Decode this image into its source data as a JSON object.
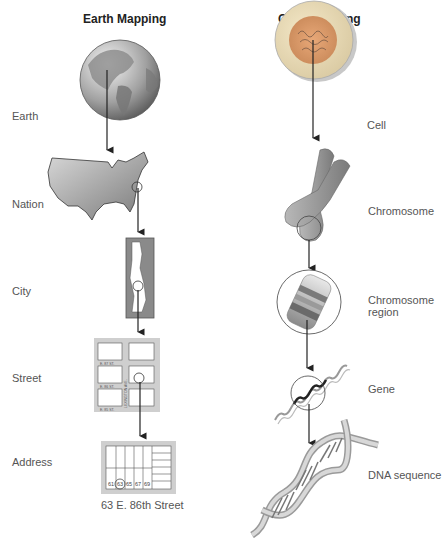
{
  "earth_column": {
    "title": "Earth Mapping",
    "levels": [
      {
        "label": "Earth",
        "icon": "globe-icon"
      },
      {
        "label": "Nation",
        "icon": "usa-map-icon"
      },
      {
        "label": "City",
        "icon": "city-map-icon"
      },
      {
        "label": "Street",
        "icon": "street-grid-icon"
      },
      {
        "label": "Address",
        "icon": "address-block-icon"
      }
    ],
    "street_labels": [
      "E. 87 ST.",
      "E. 86 ST.",
      "E. 85 ST."
    ],
    "avenue_label": "LEXINGTON AVE.",
    "house_numbers": [
      "61",
      "63",
      "65",
      "67",
      "69"
    ],
    "highlighted_house": "63",
    "address_caption": "63 E. 86th Street"
  },
  "gene_column": {
    "title": "Gene Mapping",
    "levels": [
      {
        "label": "Cell",
        "icon": "cell-icon"
      },
      {
        "label": "Chromosome",
        "icon": "chromosome-icon"
      },
      {
        "label": "Chromosome region",
        "label_line1": "Chromosome",
        "label_line2": "region",
        "icon": "chromosome-region-icon"
      },
      {
        "label": "Gene",
        "icon": "gene-helix-icon"
      },
      {
        "label": "DNA sequence",
        "icon": "dna-double-helix-icon"
      }
    ]
  },
  "colors": {
    "arrow": "#222222",
    "illustration_gray": "#9a9a9a",
    "light_gray": "#d4d4d4",
    "cell_orange": "#e8a070",
    "cell_nucleus": "#c88a60"
  }
}
